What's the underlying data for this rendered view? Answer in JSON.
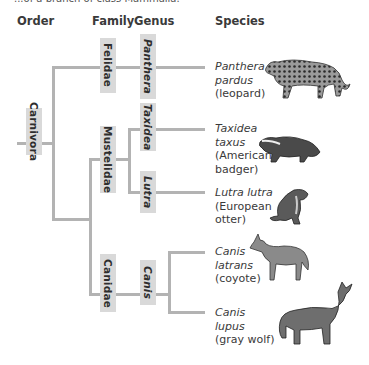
{
  "caption": "...of a branch of class Mammalia.",
  "headers": {
    "order": "Order",
    "family": "Family",
    "genus": "Genus",
    "species": "Species"
  },
  "order": {
    "label": "Carnivora"
  },
  "families": [
    {
      "label": "Felidae"
    },
    {
      "label": "Mustelidae"
    },
    {
      "label": "Canidae"
    }
  ],
  "genera": [
    {
      "label": "Panthera"
    },
    {
      "label": "Taxidea"
    },
    {
      "label": "Lutra"
    },
    {
      "label": "Canis"
    }
  ],
  "species": [
    {
      "sci1": "Panthera",
      "sci2": "pardus",
      "common1": "(leopard)",
      "common2": "",
      "icon": "leopard-illustration"
    },
    {
      "sci1": "Taxidea",
      "sci2": "taxus",
      "common1": "(American",
      "common2": "badger)",
      "icon": "badger-illustration"
    },
    {
      "sci1": "Lutra lutra",
      "sci2": "",
      "common1": "(European",
      "common2": "otter)",
      "icon": "otter-illustration"
    },
    {
      "sci1": "Canis",
      "sci2": "latrans",
      "common1": "(coyote)",
      "common2": "",
      "icon": "coyote-illustration"
    },
    {
      "sci1": "Canis",
      "sci2": "lupus",
      "common1": "(gray wolf)",
      "common2": "",
      "icon": "wolf-illustration"
    }
  ],
  "colors": {
    "branch": "#b3b3b3",
    "label_box": "#d9d9d9"
  }
}
